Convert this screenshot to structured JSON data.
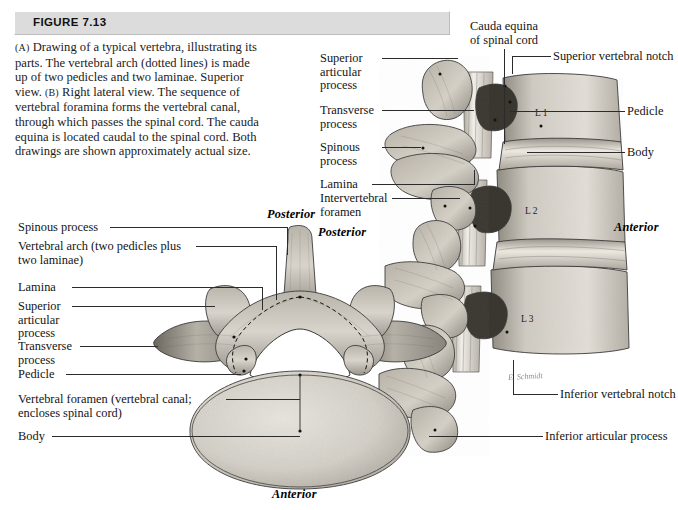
{
  "figure": {
    "number_label": "FIGURE 7.13",
    "caption_parts": {
      "a_marker": "(A)",
      "a_text": " Drawing of a typical vertebra, illustrating its parts. The vertebral arch (dotted lines) is made up of two pedicles and two laminae. Superior view. ",
      "b_marker": "(B)",
      "b_text": " Right lateral view. The sequence of vertebral foramina forms the vertebral canal, through which passes the spinal cord. The cauda equina is located caudal to the spinal cord. Both drawings are shown approximately actual size."
    }
  },
  "lateral_view": {
    "left_labels": [
      {
        "text": "Superior\narticular\nprocess"
      },
      {
        "text": "Transverse\nprocess"
      },
      {
        "text": "Spinous\nprocess"
      },
      {
        "text": "Lamina"
      },
      {
        "text": "Intervertebral\nforamen"
      }
    ],
    "top_label": {
      "text": "Cauda equina\nof spinal cord"
    },
    "right_labels": [
      {
        "text": "Superior vertebral notch"
      },
      {
        "text": "Pedicle"
      },
      {
        "text": "Body"
      },
      {
        "text": "Inferior vertebral notch"
      },
      {
        "text": "Inferior articular process"
      }
    ],
    "vertebra_levels": [
      "L 1",
      "L 2",
      "L 3"
    ],
    "orientation": {
      "posterior": "Posterior",
      "anterior": "Anterior"
    },
    "artist_signature": "E. Schmidt"
  },
  "superior_view": {
    "left_labels": [
      {
        "text": "Spinous process"
      },
      {
        "text": "Vertebral arch  (two pedicles plus\ntwo laminae)"
      },
      {
        "text": "Lamina"
      },
      {
        "text": "Superior\narticular\nprocess"
      },
      {
        "text": "Transverse\nprocess"
      },
      {
        "text": "Pedicle"
      },
      {
        "text": "Vertebral foramen (vertebral canal;\nencloses spinal cord)"
      },
      {
        "text": "Body"
      }
    ],
    "orientation": {
      "posterior": "Posterior",
      "anterior": "Anterior"
    }
  },
  "colors": {
    "header_bar": "#dcdcdc",
    "text": "#141414",
    "leader_line": "#2b2b2b",
    "bone_light": "#cdc8bf",
    "bone_mid": "#a9a49a",
    "bone_dark": "#6e6a62",
    "bone_shadow": "#3f3c37",
    "page_background": "#ffffff"
  }
}
